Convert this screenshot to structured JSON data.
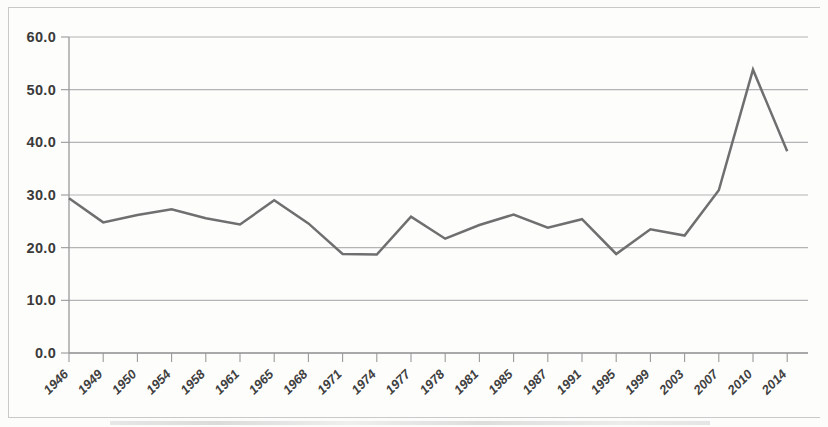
{
  "chart_data": {
    "type": "line",
    "title": "",
    "subtitle": "",
    "xlabel": "",
    "ylabel": "",
    "ylim": [
      0.0,
      60.0
    ],
    "grid": true,
    "legend": false,
    "legend_position": "none",
    "line_color": "#6f6f6f",
    "gridline_color": "#b4b4b4",
    "axis_color": "#9a9a9a",
    "background_color": "#fdfdfc",
    "y_ticks": [
      "0.0",
      "10.0",
      "20.0",
      "30.0",
      "40.0",
      "50.0",
      "60.0"
    ],
    "y_tick_values": [
      0.0,
      10.0,
      20.0,
      30.0,
      40.0,
      50.0,
      60.0
    ],
    "categories": [
      "1946",
      "1949",
      "1950",
      "1954",
      "1958",
      "1961",
      "1965",
      "1968",
      "1971",
      "1974",
      "1977",
      "1978",
      "1981",
      "1985",
      "1987",
      "1991",
      "1995",
      "1999",
      "2003",
      "2007",
      "2010",
      "2014"
    ],
    "series": [
      {
        "name": "",
        "values": [
          29.4,
          24.8,
          26.2,
          27.3,
          25.6,
          24.4,
          29.0,
          24.6,
          18.8,
          18.7,
          25.9,
          21.7,
          24.3,
          26.3,
          23.8,
          25.4,
          18.8,
          23.5,
          22.3,
          30.9,
          53.8,
          38.3
        ]
      }
    ]
  }
}
